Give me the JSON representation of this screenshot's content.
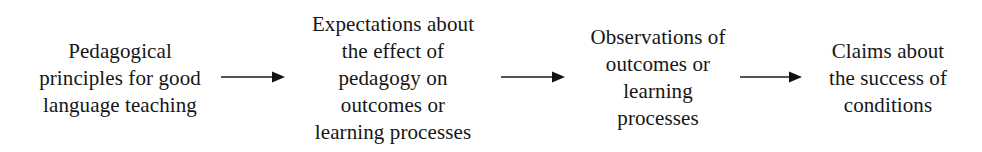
{
  "diagram": {
    "type": "linear-flow",
    "orientation": "left-to-right",
    "background_color": "#ffffff",
    "text_color": "#161616",
    "arrow_color": "#1b1b1b",
    "nodes": [
      {
        "id": "node-principles",
        "name": "pedagogical-principles",
        "center_x": 120,
        "center_y": 78,
        "lines": [
          "Pedagogical",
          "principles for good",
          "language teaching"
        ]
      },
      {
        "id": "node-expectations",
        "name": "expectations",
        "center_x": 393,
        "center_y": 78,
        "lines": [
          "Expectations about",
          "the effect of",
          "pedagogy on",
          "outcomes or",
          "learning processes"
        ]
      },
      {
        "id": "node-observations",
        "name": "observations",
        "center_x": 658,
        "center_y": 78,
        "lines": [
          "Observations of",
          "outcomes or",
          "learning",
          "processes"
        ]
      },
      {
        "id": "node-claims",
        "name": "claims",
        "center_x": 888,
        "center_y": 78,
        "lines": [
          "Claims about",
          "the success of",
          "conditions"
        ]
      }
    ],
    "arrows": [
      {
        "id": "arrow-1",
        "name": "arrow-principles-to-expectations",
        "from": "node-principles",
        "to": "node-expectations",
        "x": 221,
        "y": 77,
        "length": 64,
        "direction": "right"
      },
      {
        "id": "arrow-2",
        "name": "arrow-expectations-to-observations",
        "from": "node-expectations",
        "to": "node-observations",
        "x": 501,
        "y": 77,
        "length": 64,
        "direction": "right"
      },
      {
        "id": "arrow-3",
        "name": "arrow-observations-to-claims",
        "from": "node-observations",
        "to": "node-claims",
        "x": 740,
        "y": 77,
        "length": 62,
        "direction": "right"
      }
    ]
  }
}
